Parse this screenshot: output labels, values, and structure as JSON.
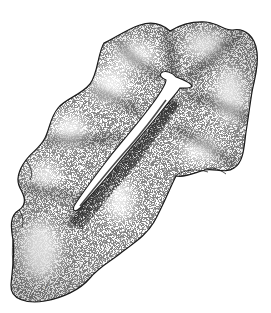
{
  "image": {
    "subject": "stippled pen-and-ink illustration of a flatworm",
    "style": "stipple",
    "background": "#ffffff",
    "ink": "#1a1a1a",
    "signature": "illegible"
  }
}
